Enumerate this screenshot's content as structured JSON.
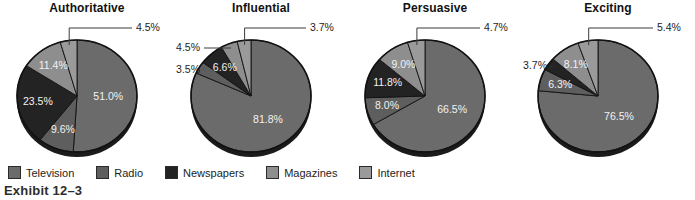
{
  "caption": "Exhibit 12–3",
  "legend": {
    "items": [
      {
        "label": "Television",
        "color": "#6b6b6b"
      },
      {
        "label": "Radio",
        "color": "#5e5e5e"
      },
      {
        "label": "Newspapers",
        "color": "#232323"
      },
      {
        "label": "Magazines",
        "color": "#8e8e8e"
      },
      {
        "label": "Internet",
        "color": "#9a9a9a"
      }
    ]
  },
  "chart_data": [
    {
      "type": "pie",
      "title": "Authoritative",
      "categories": [
        "Television",
        "Radio",
        "Newspapers",
        "Magazines",
        "Internet"
      ],
      "values": [
        51.0,
        9.6,
        23.5,
        11.4,
        4.5
      ],
      "labels": [
        "51.0%",
        "9.6%",
        "23.5%",
        "11.4%",
        "4.5%"
      ],
      "colors": [
        "#6b6b6b",
        "#5e5e5e",
        "#232323",
        "#8e8e8e",
        "#9a9a9a"
      ],
      "label_placement": [
        "inside",
        "inside",
        "inside",
        "inside",
        "callout-right"
      ],
      "legend_position": "bottom-shared"
    },
    {
      "type": "pie",
      "title": "Influential",
      "categories": [
        "Television",
        "Radio",
        "Newspapers",
        "Magazines",
        "Internet"
      ],
      "values": [
        81.8,
        3.5,
        6.6,
        4.5,
        3.7
      ],
      "labels": [
        "81.8%",
        "3.5%",
        "6.6%",
        "4.5%",
        "3.7%"
      ],
      "colors": [
        "#6b6b6b",
        "#5e5e5e",
        "#232323",
        "#8e8e8e",
        "#9a9a9a"
      ],
      "label_placement": [
        "inside",
        "callout-left",
        "inside",
        "callout-left",
        "callout-right"
      ],
      "legend_position": "bottom-shared"
    },
    {
      "type": "pie",
      "title": "Persuasive",
      "categories": [
        "Television",
        "Radio",
        "Newspapers",
        "Magazines",
        "Internet"
      ],
      "values": [
        66.5,
        8.0,
        11.8,
        9.0,
        4.7
      ],
      "labels": [
        "66.5%",
        "8.0%",
        "11.8%",
        "9.0%",
        "4.7%"
      ],
      "colors": [
        "#6b6b6b",
        "#5e5e5e",
        "#232323",
        "#8e8e8e",
        "#9a9a9a"
      ],
      "label_placement": [
        "inside",
        "inside",
        "inside",
        "inside",
        "callout-right"
      ],
      "legend_position": "bottom-shared"
    },
    {
      "type": "pie",
      "title": "Exciting",
      "categories": [
        "Television",
        "Radio",
        "Newspapers",
        "Magazines",
        "Internet"
      ],
      "values": [
        76.5,
        6.3,
        3.7,
        8.1,
        5.4
      ],
      "labels": [
        "76.5%",
        "6.3%",
        "3.7%",
        "8.1%",
        "5.4%"
      ],
      "colors": [
        "#6b6b6b",
        "#5e5e5e",
        "#232323",
        "#8e8e8e",
        "#9a9a9a"
      ],
      "label_placement": [
        "inside",
        "inside",
        "callout-left",
        "inside",
        "callout-right"
      ],
      "legend_position": "bottom-shared"
    }
  ]
}
